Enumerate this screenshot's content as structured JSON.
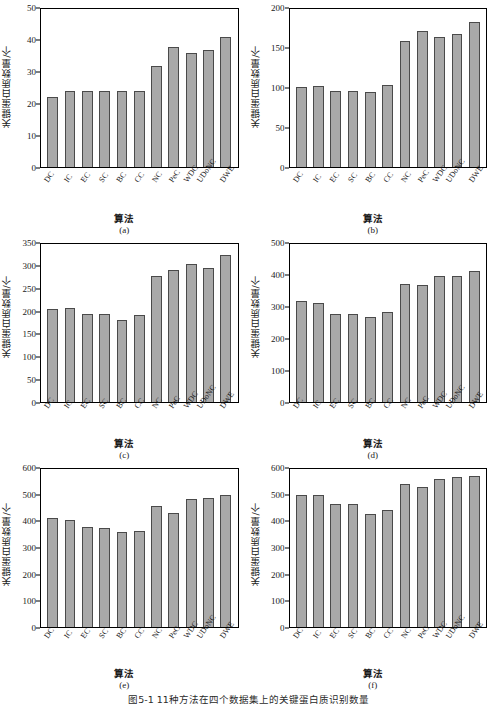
{
  "figure": {
    "caption": "图5-1  11种方法在四个数据集上的关键蛋白质识别数量",
    "ylabel": "关键蛋白质数量/个",
    "xlabel": "算法",
    "bar_color": "#a9a9a9",
    "bar_border_color": "#4a4a4a"
  },
  "chart_data": [
    {
      "type": "bar",
      "title": "(a)",
      "xlabel": "算法",
      "ylabel": "关键蛋白质数量/个",
      "categories": [
        "DC",
        "IC",
        "EC",
        "SC",
        "BC",
        "CC",
        "NC",
        "PeC",
        "WDC",
        "UDoNC",
        "DWE"
      ],
      "values": [
        22,
        24,
        24,
        24,
        24,
        24,
        32,
        38,
        36,
        37,
        41
      ],
      "ylim": [
        0,
        50
      ],
      "yticks": [
        0,
        10,
        20,
        30,
        40,
        50
      ],
      "grid": false,
      "legend": "none"
    },
    {
      "type": "bar",
      "title": "(b)",
      "xlabel": "算法",
      "ylabel": "关键蛋白质数量/个",
      "categories": [
        "DC",
        "IC",
        "EC",
        "SC",
        "BC",
        "CC",
        "NC",
        "PeC",
        "WDC",
        "UDoNC",
        "DWE"
      ],
      "values": [
        101,
        102,
        96,
        96,
        95,
        104,
        159,
        172,
        165,
        169,
        184
      ],
      "ylim": [
        0,
        200
      ],
      "yticks": [
        0,
        50,
        100,
        150,
        200
      ],
      "grid": false,
      "legend": "none"
    },
    {
      "type": "bar",
      "title": "(c)",
      "xlabel": "算法",
      "ylabel": "关键蛋白质数量/个",
      "categories": [
        "DC",
        "IC",
        "EC",
        "SC",
        "BC",
        "CC",
        "NC",
        "PeC",
        "WDC",
        "UDoNC",
        "DWE"
      ],
      "values": [
        206,
        209,
        195,
        195,
        181,
        193,
        280,
        292,
        305,
        296,
        326
      ],
      "ylim": [
        0,
        350
      ],
      "yticks": [
        0,
        50,
        100,
        150,
        200,
        250,
        300,
        350
      ],
      "grid": false,
      "legend": "none"
    },
    {
      "type": "bar",
      "title": "(d)",
      "xlabel": "算法",
      "ylabel": "关键蛋白质数量/个",
      "categories": [
        "DC",
        "IC",
        "EC",
        "SC",
        "BC",
        "CC",
        "NC",
        "PeC",
        "WDC",
        "UDoNC",
        "DWE"
      ],
      "values": [
        320,
        314,
        279,
        279,
        270,
        284,
        373,
        371,
        400,
        400,
        415
      ],
      "ylim": [
        0,
        500
      ],
      "yticks": [
        0,
        100,
        200,
        300,
        400,
        500
      ],
      "grid": false,
      "legend": "none"
    },
    {
      "type": "bar",
      "title": "(e)",
      "xlabel": "算法",
      "ylabel": "关键蛋白质数量/个",
      "categories": [
        "DC",
        "IC",
        "EC",
        "SC",
        "BC",
        "CC",
        "NC",
        "PeC",
        "WDC",
        "UDoNC",
        "DWE"
      ],
      "values": [
        413,
        408,
        378,
        377,
        359,
        364,
        461,
        434,
        488,
        490,
        501
      ],
      "ylim": [
        0,
        600
      ],
      "yticks": [
        0,
        100,
        200,
        300,
        400,
        500,
        600
      ],
      "grid": false,
      "legend": "none"
    },
    {
      "type": "bar",
      "title": "(f)",
      "xlabel": "算法",
      "ylabel": "关键蛋白质数量/个",
      "categories": [
        "DC",
        "IC",
        "EC",
        "SC",
        "BC",
        "CC",
        "NC",
        "PeC",
        "WDC",
        "UDoNC",
        "DWE"
      ],
      "values": [
        503,
        502,
        466,
        466,
        431,
        446,
        542,
        533,
        561,
        570,
        574
      ],
      "ylim": [
        0,
        600
      ],
      "yticks": [
        0,
        100,
        200,
        300,
        400,
        500,
        600
      ],
      "grid": false,
      "legend": "none"
    }
  ]
}
